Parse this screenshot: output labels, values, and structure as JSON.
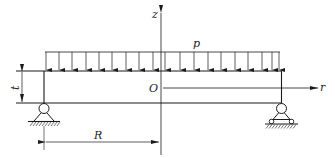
{
  "diagram": {
    "type": "simply supported circular plate under uniform load (cross-section)",
    "labels": {
      "z_axis": "z",
      "r_axis": "r",
      "origin": "O",
      "load": "p",
      "thickness": "t",
      "radius": "R"
    },
    "load_arrows_count": 19,
    "supports": {
      "left": "pinned support",
      "right": "roller support"
    },
    "colors": {
      "line": "#1a1a1a",
      "background": "#ffffff"
    }
  }
}
